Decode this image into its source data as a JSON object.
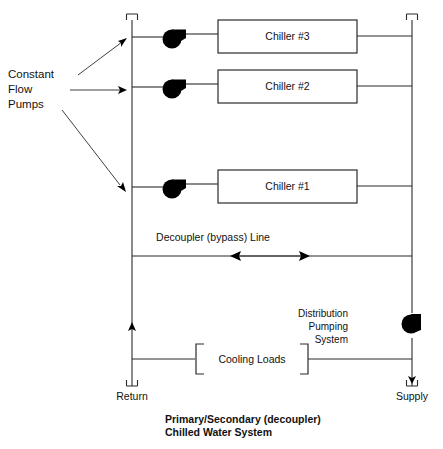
{
  "diagram": {
    "caption_line1": "Primary/Secondary (decoupler)",
    "caption_line2": "Chilled Water System",
    "colors": {
      "line": "#2b2b2b",
      "fill": "#000000",
      "background": "#ffffff",
      "text": "#111111"
    },
    "annotations": {
      "constant_flow_pumps_line1": "Constant",
      "constant_flow_pumps_line2": "Flow",
      "constant_flow_pumps_line3": "Pumps",
      "decoupler_line": "Decoupler (bypass) Line",
      "distribution_line1": "Distribution",
      "distribution_line2": "Pumping",
      "distribution_line3": "System",
      "cooling_loads": "Cooling Loads"
    },
    "terminals": {
      "return": "Return",
      "supply": "Supply"
    },
    "chillers": [
      {
        "label": "Chiller #3",
        "row_y": 37
      },
      {
        "label": "Chiller #2",
        "row_y": 87
      },
      {
        "label": "Chiller #1",
        "row_y": 187
      }
    ],
    "icons": {
      "pump": "pump-icon",
      "cap_terminal": "pipe-cap-icon",
      "arrow_double": "double-arrow-icon",
      "arrow_up": "up-arrow-icon",
      "arrow_down": "down-arrow-icon"
    }
  }
}
